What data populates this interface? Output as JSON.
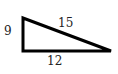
{
  "diagram": {
    "type": "right-triangle",
    "stroke_color": "#000000",
    "label_color": "#222222",
    "vertices": {
      "top_left": [
        23,
        18
      ],
      "bottom_left": [
        23,
        51
      ],
      "bottom_right": [
        111,
        51
      ]
    },
    "sides": [
      {
        "name": "vertical-leg",
        "label": "9"
      },
      {
        "name": "hypotenuse",
        "label": "15"
      },
      {
        "name": "horizontal-leg",
        "label": "12"
      }
    ]
  }
}
